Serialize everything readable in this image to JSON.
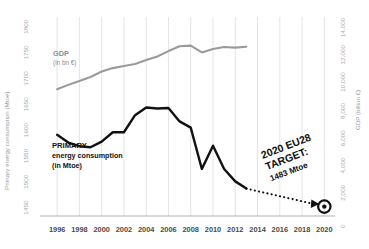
{
  "chart_data": {
    "type": "line",
    "title": "",
    "xlabel": "",
    "ylabel": "Primary energy consumption (Mtoe)",
    "y2label": "GDP (billion €)",
    "x": [
      1996,
      1997,
      1998,
      1999,
      2000,
      2001,
      2002,
      2003,
      2004,
      2005,
      2006,
      2007,
      2008,
      2009,
      2010,
      2011,
      2012,
      2013
    ],
    "xticks": [
      "1996",
      "1998",
      "2000",
      "2002",
      "2004",
      "2006",
      "2008",
      "2010",
      "2012",
      "2014",
      "2016",
      "2018",
      "2020"
    ],
    "xlim": [
      1995,
      2020.6
    ],
    "yticks": [
      "1450",
      "1500",
      "1550",
      "1600",
      "1650",
      "1700",
      "1750",
      "1800"
    ],
    "ylim": [
      1430,
      1815
    ],
    "y2ticks": [
      "0",
      "2,000",
      "4,000",
      "6,000",
      "8,000",
      "10,000",
      "12,000",
      "14,000"
    ],
    "y2lim": [
      0,
      14600
    ],
    "grid": true,
    "legend_position": "inline-annotations",
    "series": [
      {
        "name": "PRIMARY energy consumption",
        "unit": "in Mtoe",
        "axis": "left",
        "color": "#111111",
        "label_bold": "PRIMARY",
        "label_line2": "energy consumption",
        "label_line3": "(in Mtoe)",
        "values": [
          1587,
          1572,
          1565,
          1563,
          1574,
          1592,
          1592,
          1625,
          1640,
          1638,
          1639,
          1613,
          1601,
          1521,
          1566,
          1521,
          1497,
          1483
        ]
      },
      {
        "name": "GDP",
        "unit": "in bn €",
        "axis": "right",
        "color": "#9a9a9a",
        "label_bold": "GDP",
        "label_line2": "(in bn €)",
        "values": [
          9300,
          9620,
          9900,
          10200,
          10600,
          10850,
          11000,
          11150,
          11450,
          11700,
          12100,
          12450,
          12500,
          12000,
          12250,
          12400,
          12350,
          12420
        ]
      }
    ],
    "annotations": [
      {
        "name": "eu28-target",
        "line1": "2020 EU28",
        "line2": "TARGET:",
        "line3": "1483 Mtoe",
        "value": 1483,
        "year": 2020,
        "marker": "bullseye",
        "connector": "dotted"
      }
    ]
  },
  "axes": {
    "left_title": "Primary energy consumption (Mtoe)",
    "right_title": "GDP (billion €)"
  }
}
